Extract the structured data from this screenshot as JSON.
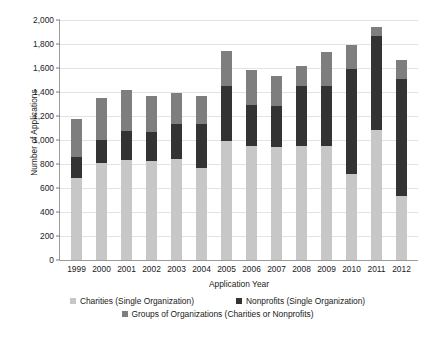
{
  "chart_data": {
    "type": "bar",
    "stacked": true,
    "title": "",
    "xlabel": "Application Year",
    "ylabel": "Number of Applications",
    "ylim": [
      0,
      2000
    ],
    "ytick_step": 200,
    "yticks": [
      "0",
      "200",
      "400",
      "600",
      "800",
      "1,000",
      "1,200",
      "1,400",
      "1,600",
      "1,800",
      "2,000"
    ],
    "grid": true,
    "legend_position": "bottom",
    "categories": [
      "1999",
      "2000",
      "2001",
      "2002",
      "2003",
      "2004",
      "2005",
      "2006",
      "2007",
      "2008",
      "2009",
      "2010",
      "2011",
      "2012"
    ],
    "series": [
      {
        "name": "Charities (Single Organization)",
        "color": "#c7c7c7",
        "values": [
          680,
          810,
          830,
          825,
          840,
          765,
          990,
          950,
          940,
          950,
          950,
          720,
          1080,
          530
        ]
      },
      {
        "name": "Nonprofits (Single Organization)",
        "color": "#333333",
        "values": [
          180,
          190,
          245,
          240,
          295,
          370,
          460,
          340,
          340,
          500,
          500,
          870,
          790,
          980
        ]
      },
      {
        "name": "Groups of Organizations (Charities or Nonprofits)",
        "color": "#7e7e7e",
        "values": [
          315,
          350,
          340,
          300,
          255,
          235,
          290,
          290,
          250,
          170,
          280,
          200,
          75,
          160
        ]
      }
    ],
    "totals": [
      1175,
      1350,
      1415,
      1365,
      1390,
      1370,
      1740,
      1580,
      1530,
      1620,
      1730,
      1790,
      1945,
      1670
    ]
  },
  "legend": {
    "items": [
      {
        "label": "Charities (Single Organization)",
        "color": "#c7c7c7"
      },
      {
        "label": "Nonprofits (Single Organization)",
        "color": "#333333"
      },
      {
        "label": "Groups of Organizations (Charities or Nonprofits)",
        "color": "#7e7e7e"
      }
    ]
  }
}
